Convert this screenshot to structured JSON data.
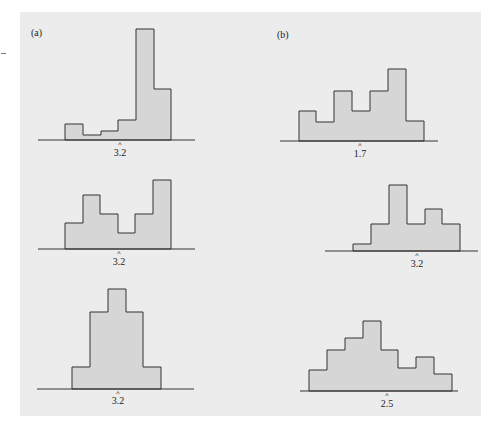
{
  "colors": {
    "panel_bg": "#ececec",
    "bar_fill": "#d6d6d6",
    "stroke": "#333333"
  },
  "panels": {
    "a_label": "(a)",
    "b_label": "(b)"
  },
  "chart_data": [
    {
      "type": "bar",
      "panel": "(a)",
      "position": "top",
      "title": "",
      "xlabel": "",
      "ylabel": "",
      "marker_label": "3.2",
      "values": [
        1,
        0.3,
        0.6,
        1.3,
        7.2,
        3.3
      ],
      "geom": {
        "baseline": 140,
        "axis": [
          38,
          195
        ],
        "edges": [
          65,
          83,
          101,
          118,
          136,
          154,
          171
        ],
        "tops": [
          124,
          135,
          131,
          120,
          29,
          89
        ],
        "marker_x": 120,
        "label_y": 156
      }
    },
    {
      "type": "bar",
      "panel": "(a)",
      "position": "middle",
      "title": "",
      "xlabel": "",
      "ylabel": "",
      "marker_label": "3.2",
      "values": [
        1.8,
        3.8,
        2.4,
        1.1,
        2.4,
        4.9
      ],
      "geom": {
        "baseline": 249,
        "axis": [
          38,
          195
        ],
        "edges": [
          65,
          83,
          100,
          118,
          135,
          153,
          171
        ],
        "tops": [
          223,
          195,
          214,
          233,
          214,
          180
        ],
        "marker_x": 119,
        "label_y": 265
      }
    },
    {
      "type": "bar",
      "panel": "(a)",
      "position": "bottom",
      "title": "",
      "xlabel": "",
      "ylabel": "",
      "marker_label": "3.2",
      "values": [
        1.4,
        5.1,
        6.6,
        5.1,
        1.4
      ],
      "geom": {
        "baseline": 389,
        "axis": [
          37,
          194
        ],
        "edges": [
          72,
          90,
          108,
          126,
          143,
          161
        ],
        "tops": [
          367,
          312,
          289,
          312,
          367
        ],
        "marker_x": 118,
        "label_y": 404
      }
    },
    {
      "type": "bar",
      "panel": "(b)",
      "position": "top",
      "title": "",
      "xlabel": "",
      "ylabel": "",
      "marker_label": "1.7",
      "values": [
        2.1,
        1.4,
        3.5,
        2.1,
        3.5,
        5.1,
        1.4
      ],
      "geom": {
        "baseline": 141,
        "axis": [
          280,
          438
        ],
        "edges": [
          299,
          316,
          334,
          352,
          370,
          388,
          406,
          424
        ],
        "tops": [
          111,
          122,
          91,
          111,
          91,
          69,
          121
        ],
        "marker_x": 360,
        "label_y": 157
      }
    },
    {
      "type": "bar",
      "panel": "(b)",
      "position": "middle",
      "title": "",
      "xlabel": "",
      "ylabel": "",
      "marker_label": "3.2",
      "values": [
        0.5,
        1.9,
        4.6,
        1.9,
        3.0,
        1.9
      ],
      "geom": {
        "baseline": 251,
        "axis": [
          325,
          478
        ],
        "edges": [
          353,
          371,
          389,
          407,
          425,
          442,
          460
        ],
        "tops": [
          244,
          224,
          185,
          224,
          209,
          224
        ],
        "marker_x": 417,
        "label_y": 267
      }
    },
    {
      "type": "bar",
      "panel": "(b)",
      "position": "bottom",
      "title": "",
      "xlabel": "",
      "ylabel": "",
      "marker_label": "2.5",
      "values": [
        1.5,
        2.9,
        3.7,
        4.9,
        2.9,
        1.6,
        2.4,
        1.2
      ],
      "geom": {
        "baseline": 391,
        "axis": [
          300,
          458
        ],
        "edges": [
          309,
          327,
          345,
          363,
          381,
          398,
          416,
          434,
          452
        ],
        "tops": [
          370,
          350,
          338,
          321,
          350,
          368,
          357,
          374
        ],
        "marker_x": 387,
        "label_y": 407
      }
    }
  ]
}
